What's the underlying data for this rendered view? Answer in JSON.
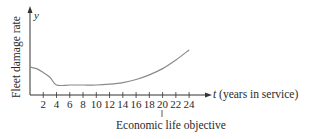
{
  "chart_data": {
    "type": "line",
    "title": "",
    "xlabel": "t (years in service)",
    "ylabel": "Fleet damage rate",
    "y_axis_symbol": "y",
    "x_axis_symbol": "t",
    "x_axis_suffix": "(years in service)",
    "x_ticks": [
      2,
      4,
      6,
      8,
      10,
      12,
      14,
      16,
      18,
      20,
      22,
      24
    ],
    "xlim": [
      0,
      24
    ],
    "y_ticks": [],
    "grid": false,
    "legend": null,
    "series": [
      {
        "name": "Fleet damage rate",
        "x": [
          0,
          1,
          2,
          3,
          4,
          6,
          8,
          10,
          12,
          14,
          16,
          18,
          20,
          22,
          24
        ],
        "y": [
          0.4,
          0.38,
          0.33,
          0.27,
          0.17,
          0.17,
          0.17,
          0.17,
          0.18,
          0.2,
          0.24,
          0.3,
          0.38,
          0.49,
          0.62
        ]
      }
    ],
    "annotations": [
      {
        "x": 20,
        "text": "Economic life objective"
      }
    ]
  },
  "labels": {
    "ylabel": "Fleet damage rate",
    "y_symbol": "y",
    "x_symbol": "t",
    "x_suffix": " (years in service)",
    "annotation": "Economic life objective"
  }
}
